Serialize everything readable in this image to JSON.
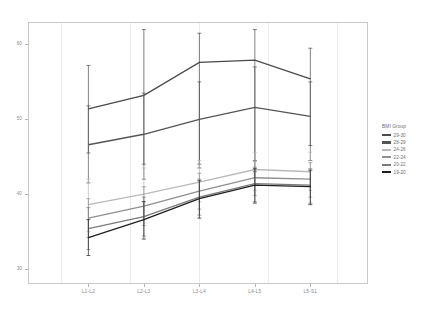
{
  "chart_data": {
    "type": "line",
    "title": "",
    "xlabel": "",
    "ylabel": "",
    "categories": [
      "L1-L2",
      "L2-L3",
      "L3-L4",
      "L4-L5",
      "L5-S1"
    ],
    "ylim": [
      28,
      63
    ],
    "yticks": [
      30,
      40,
      50,
      60
    ],
    "grid": true,
    "legend_position": "right",
    "legend_title": "BMI Group",
    "series": [
      {
        "name": "29-30",
        "color": "#4a4a4a",
        "values": [
          51.4,
          53.2,
          57.6,
          57.9,
          55.4
        ],
        "err_low": [
          45.5,
          44.0,
          44.0,
          43.0,
          46.5
        ],
        "err_high": [
          57.2,
          62.0,
          61.5,
          62.0,
          59.5
        ]
      },
      {
        "name": "28-29",
        "color": "#555555",
        "values": [
          46.6,
          48.0,
          50.0,
          51.6,
          50.4
        ],
        "err_low": [
          41.5,
          42.0,
          43.5,
          44.5,
          44.5
        ],
        "err_high": [
          51.8,
          53.5,
          55.0,
          57.0,
          55.0
        ]
      },
      {
        "name": "24-26",
        "color": "#b9b9b9",
        "values": [
          38.6,
          40.0,
          41.6,
          43.3,
          43.0
        ],
        "err_low": [
          35.0,
          37.0,
          39.0,
          40.5,
          40.5
        ],
        "err_high": [
          42.0,
          43.5,
          44.5,
          45.6,
          45.6
        ]
      },
      {
        "name": "22-24",
        "color": "#8f8f8f",
        "values": [
          36.8,
          38.4,
          40.4,
          42.2,
          42.0
        ],
        "err_low": [
          34.2,
          35.8,
          38.0,
          39.8,
          39.6
        ],
        "err_high": [
          39.4,
          41.0,
          42.8,
          44.4,
          44.2
        ]
      },
      {
        "name": "20-22",
        "color": "#7a7a7a",
        "values": [
          35.4,
          37.0,
          39.6,
          41.4,
          41.2
        ],
        "err_low": [
          32.6,
          34.4,
          37.2,
          39.0,
          38.8
        ],
        "err_high": [
          38.2,
          39.6,
          42.0,
          43.6,
          43.4
        ]
      },
      {
        "name": "19-20",
        "color": "#1f1f1f",
        "values": [
          34.2,
          36.6,
          39.4,
          41.2,
          41.0
        ],
        "err_low": [
          31.8,
          34.0,
          36.8,
          38.8,
          38.6
        ],
        "err_high": [
          36.6,
          39.0,
          41.8,
          43.4,
          43.2
        ]
      }
    ]
  }
}
